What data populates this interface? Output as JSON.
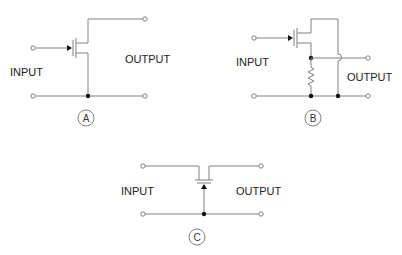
{
  "diagram": {
    "colors": {
      "wire": "#808080",
      "junction": "#111111",
      "text": "#222222"
    },
    "circuits": [
      {
        "id": "A",
        "input_label": "INPUT",
        "output_label": "OUTPUT",
        "badge": "A"
      },
      {
        "id": "B",
        "input_label": "INPUT",
        "output_label": "OUTPUT",
        "badge": "B"
      },
      {
        "id": "C",
        "input_label": "INPUT",
        "output_label": "OUTPUT",
        "badge": "C"
      }
    ]
  }
}
